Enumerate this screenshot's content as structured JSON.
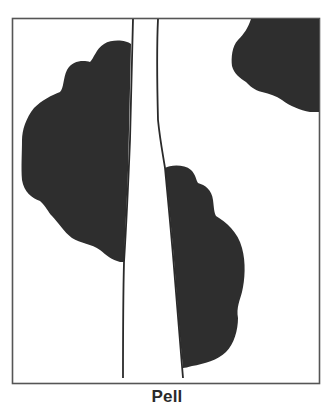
{
  "figure": {
    "caption": "Pell",
    "colors": {
      "background": "#ffffff",
      "frame": "#555555",
      "canopy": "#2e2e2e",
      "road_line": "#2a2a2a"
    },
    "elements": [
      {
        "type": "frame",
        "label": "map-frame"
      },
      {
        "type": "road",
        "label": "road-corridor"
      },
      {
        "type": "canopy",
        "label": "canopy-left"
      },
      {
        "type": "canopy",
        "label": "canopy-right-lower"
      },
      {
        "type": "canopy",
        "label": "canopy-top-right"
      }
    ]
  }
}
